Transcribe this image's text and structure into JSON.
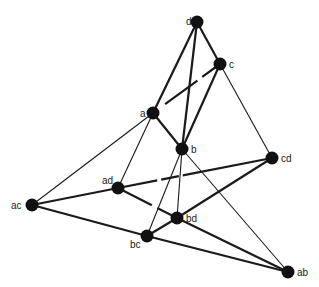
{
  "diagram": {
    "type": "graph",
    "colors": {
      "edge": "#1a1a1a",
      "node": "#111111",
      "label": "#222222",
      "background": "#ffffff"
    },
    "nodes": [
      {
        "id": "d",
        "label": "d",
        "x": 197,
        "y": 22,
        "lx": 186,
        "ly": 25
      },
      {
        "id": "c",
        "label": "c",
        "x": 220,
        "y": 64,
        "lx": 229,
        "ly": 68
      },
      {
        "id": "a",
        "label": "a",
        "x": 153,
        "y": 113,
        "lx": 140,
        "ly": 117
      },
      {
        "id": "b",
        "label": "b",
        "x": 182,
        "y": 149,
        "lx": 191,
        "ly": 153
      },
      {
        "id": "cd",
        "label": "cd",
        "x": 272,
        "y": 158,
        "lx": 281,
        "ly": 162
      },
      {
        "id": "ad",
        "label": "ad",
        "x": 118,
        "y": 188,
        "lx": 102,
        "ly": 184
      },
      {
        "id": "ac",
        "label": "ac",
        "x": 32,
        "y": 205,
        "lx": 11,
        "ly": 209
      },
      {
        "id": "bd",
        "label": "bd",
        "x": 177,
        "y": 218,
        "lx": 186,
        "ly": 222
      },
      {
        "id": "bc",
        "label": "bc",
        "x": 147,
        "y": 236,
        "lx": 130,
        "ly": 248
      },
      {
        "id": "ab",
        "label": "ab",
        "x": 288,
        "y": 272,
        "lx": 297,
        "ly": 276
      }
    ],
    "edges": [
      {
        "from": "d",
        "to": "a",
        "w": 2.2
      },
      {
        "from": "d",
        "to": "b",
        "w": 2.2
      },
      {
        "from": "d",
        "to": "c",
        "w": 2.2
      },
      {
        "from": "c",
        "to": "a",
        "w": 2.2,
        "dash": "22 6 40"
      },
      {
        "from": "c",
        "to": "b",
        "w": 2.2
      },
      {
        "from": "a",
        "to": "b",
        "w": 2.2
      },
      {
        "from": "a",
        "to": "ac",
        "w": 1.1
      },
      {
        "from": "a",
        "to": "ad",
        "w": 1.1
      },
      {
        "from": "c",
        "to": "cd",
        "w": 1.1
      },
      {
        "from": "b",
        "to": "bc",
        "w": 1.1
      },
      {
        "from": "b",
        "to": "bd",
        "w": 1.1
      },
      {
        "from": "b",
        "to": "ab",
        "w": 1.1
      },
      {
        "from": "ac",
        "to": "ad",
        "w": 2.2
      },
      {
        "from": "ac",
        "to": "bc",
        "w": 2.2
      },
      {
        "from": "ad",
        "to": "cd",
        "w": 2.2,
        "dash": "40 4 18 4 100"
      },
      {
        "from": "ad",
        "to": "bd",
        "w": 2.2,
        "dash": "38 6 30"
      },
      {
        "from": "bd",
        "to": "cd",
        "w": 2.2
      },
      {
        "from": "bd",
        "to": "bc",
        "w": 2.2
      },
      {
        "from": "bd",
        "to": "ab",
        "w": 2.2
      },
      {
        "from": "bc",
        "to": "ab",
        "w": 2.2
      }
    ]
  }
}
